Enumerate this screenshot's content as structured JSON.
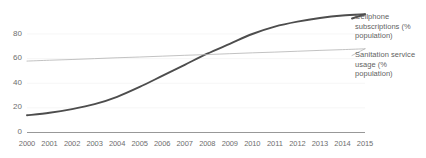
{
  "chart_data": {
    "type": "line",
    "title": "",
    "subtitle": "",
    "xlabel": "",
    "ylabel": "",
    "grid": true,
    "grid_style": "faint horizontal",
    "legend_position": "right",
    "xlim": [
      2000,
      2015
    ],
    "ylim": [
      0,
      100
    ],
    "yticks": [
      0,
      20,
      40,
      60,
      80
    ],
    "x": [
      2000,
      2001,
      2002,
      2003,
      2004,
      2005,
      2006,
      2007,
      2008,
      2009,
      2010,
      2011,
      2012,
      2013,
      2014,
      2015
    ],
    "xticks": [
      "2000",
      "2001",
      "2002",
      "2003",
      "2004",
      "2005",
      "2006",
      "2007",
      "2008",
      "2009",
      "2010",
      "2011",
      "2012",
      "2013",
      "2014",
      "2015"
    ],
    "series": [
      {
        "name": "Cellphone subscriptions (% population)",
        "color": "#4d4d4d",
        "width": 1.9,
        "values": [
          14,
          16,
          19,
          23,
          29,
          37,
          46,
          55,
          64,
          72,
          80,
          86,
          90,
          93,
          95,
          96
        ]
      },
      {
        "name": "Sanitation service usage (% population)",
        "color": "#b3b3b3",
        "width": 0.8,
        "values": [
          58.0,
          58.7,
          59.3,
          60.0,
          60.7,
          61.3,
          62.0,
          62.7,
          63.3,
          64.0,
          64.7,
          65.3,
          66.0,
          66.7,
          67.3,
          68.0
        ]
      }
    ],
    "annotations": [
      "Curves intersect near 2008-2009 at approximately 63%"
    ]
  },
  "legend": {
    "cellphone": "Cellphone subscriptions (% population)",
    "sanitation": "Sanitation service usage (% population)"
  },
  "axis": {
    "y_labels": [
      "80",
      "60",
      "40",
      "20",
      "0"
    ],
    "x_labels": [
      "2000",
      "2001",
      "2002",
      "2003",
      "2004",
      "2005",
      "2006",
      "2007",
      "2008",
      "2009",
      "2010",
      "2011",
      "2012",
      "2013",
      "2014",
      "2015"
    ]
  },
  "colors": {
    "background": "#ffffff",
    "axis": "#808080",
    "tick_text": "#6e6e6e",
    "gridline": "#f2f2f2",
    "series_cellphone": "#4d4d4d",
    "series_sanitation": "#b3b3b3"
  }
}
